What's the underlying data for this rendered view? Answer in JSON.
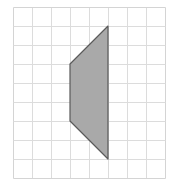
{
  "diagram": {
    "grid": {
      "origin_x": 13,
      "origin_y": 7,
      "cell_w": 19,
      "cell_h": 19,
      "cols": 8,
      "rows": 9,
      "line_color": "#dcdcdc",
      "border_color": "#d4d4d4"
    },
    "shape": {
      "type": "quadrilateral",
      "vertices_grid": [
        [
          5,
          1
        ],
        [
          3,
          3
        ],
        [
          3,
          6
        ],
        [
          5,
          8
        ]
      ],
      "fill": "#a9a9a9",
      "stroke": "#5a5a5a"
    }
  }
}
